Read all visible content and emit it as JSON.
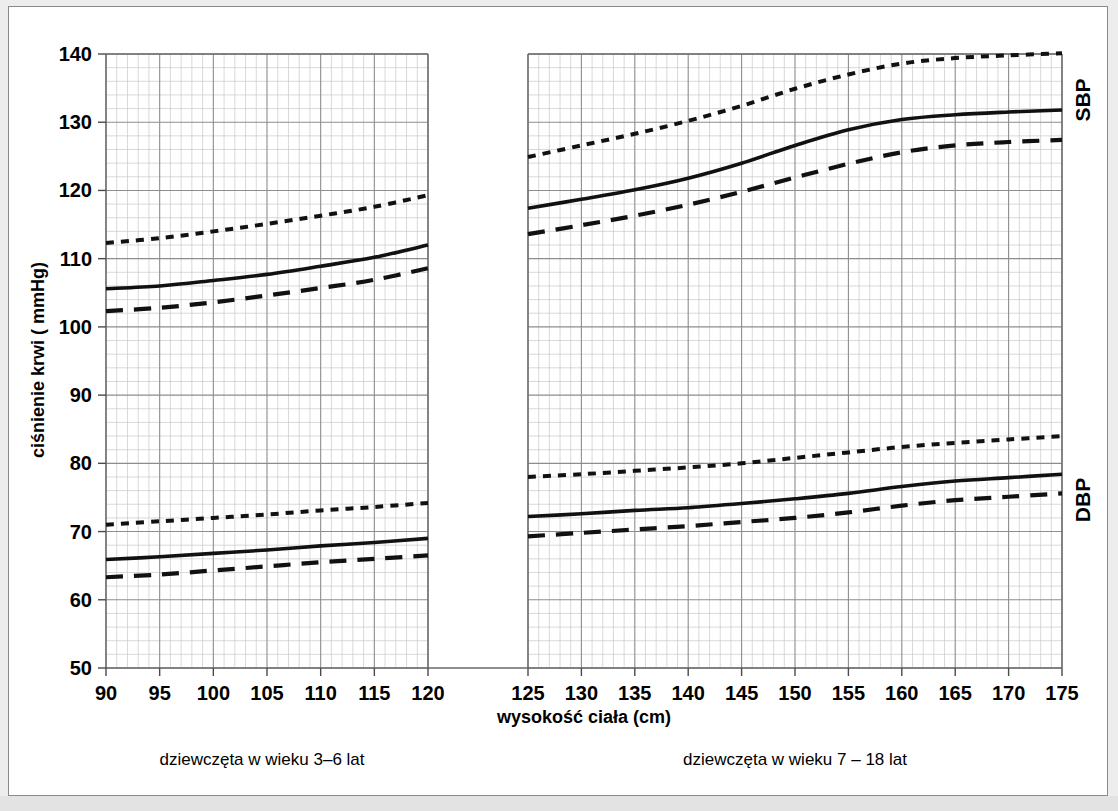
{
  "chart_data": {
    "type": "line",
    "title": "",
    "xlabel": "wysokość ciała (cm)",
    "ylabel": "ciśnienie krwi ( mmHg)",
    "ylim": [
      50,
      140
    ],
    "y_major_step": 10,
    "y_minor_step": 2,
    "y_ticks": [
      50,
      60,
      70,
      80,
      90,
      100,
      110,
      120,
      130,
      140
    ],
    "grid": true,
    "legend_position": "none",
    "panels": [
      {
        "id": "left",
        "caption": "dziewczęta w wieku 3–6 lat",
        "xlim": [
          90,
          120
        ],
        "x_ticks": [
          90,
          95,
          100,
          105,
          110,
          115,
          120
        ],
        "x_minor_step": 1,
        "groups": [
          {
            "name": "SBP",
            "series": [
              {
                "name": "95th percentile",
                "style": "fine-dotted",
                "x": [
                  90,
                  95,
                  100,
                  105,
                  110,
                  115,
                  120
                ],
                "values": [
                  112.3,
                  113.0,
                  114.0,
                  115.1,
                  116.3,
                  117.6,
                  119.3
                ]
              },
              {
                "name": "50th percentile",
                "style": "solid",
                "x": [
                  90,
                  95,
                  100,
                  105,
                  110,
                  115,
                  120
                ],
                "values": [
                  105.6,
                  106.0,
                  106.8,
                  107.7,
                  108.9,
                  110.2,
                  112.0
                ]
              },
              {
                "name": "5th percentile",
                "style": "long-dashed",
                "x": [
                  90,
                  95,
                  100,
                  105,
                  110,
                  115,
                  120
                ],
                "values": [
                  102.3,
                  102.8,
                  103.6,
                  104.6,
                  105.7,
                  106.9,
                  108.6
                ]
              }
            ]
          },
          {
            "name": "DBP",
            "series": [
              {
                "name": "95th percentile",
                "style": "fine-dotted",
                "x": [
                  90,
                  95,
                  100,
                  105,
                  110,
                  115,
                  120
                ],
                "values": [
                  71.0,
                  71.5,
                  72.0,
                  72.5,
                  73.1,
                  73.6,
                  74.2
                ]
              },
              {
                "name": "50th percentile",
                "style": "solid",
                "x": [
                  90,
                  95,
                  100,
                  105,
                  110,
                  115,
                  120
                ],
                "values": [
                  65.9,
                  66.3,
                  66.8,
                  67.3,
                  67.9,
                  68.4,
                  69.0
                ]
              },
              {
                "name": "5th percentile",
                "style": "long-dashed",
                "x": [
                  90,
                  95,
                  100,
                  105,
                  110,
                  115,
                  120
                ],
                "values": [
                  63.3,
                  63.7,
                  64.3,
                  64.9,
                  65.5,
                  66.0,
                  66.5
                ]
              }
            ]
          }
        ]
      },
      {
        "id": "right",
        "caption": "dziewczęta w wieku 7 – 18 lat",
        "xlim": [
          125,
          175
        ],
        "x_ticks": [
          125,
          130,
          135,
          140,
          145,
          150,
          155,
          160,
          165,
          170,
          175
        ],
        "x_minor_step": 1,
        "groups": [
          {
            "name": "SBP",
            "series": [
              {
                "name": "95th percentile",
                "style": "fine-dotted",
                "x": [
                  125,
                  130,
                  135,
                  140,
                  145,
                  150,
                  155,
                  160,
                  165,
                  170,
                  175
                ],
                "values": [
                  124.9,
                  126.6,
                  128.3,
                  130.2,
                  132.4,
                  134.9,
                  137.0,
                  138.6,
                  139.4,
                  139.8,
                  140.1
                ]
              },
              {
                "name": "50th percentile",
                "style": "solid",
                "x": [
                  125,
                  130,
                  135,
                  140,
                  145,
                  150,
                  155,
                  160,
                  165,
                  170,
                  175
                ],
                "values": [
                  117.4,
                  118.7,
                  120.1,
                  121.8,
                  124.0,
                  126.6,
                  128.9,
                  130.4,
                  131.1,
                  131.5,
                  131.8
                ]
              },
              {
                "name": "5th percentile",
                "style": "long-dashed",
                "x": [
                  125,
                  130,
                  135,
                  140,
                  145,
                  150,
                  155,
                  160,
                  165,
                  170,
                  175
                ],
                "values": [
                  113.6,
                  114.9,
                  116.3,
                  117.9,
                  119.8,
                  121.9,
                  123.9,
                  125.6,
                  126.6,
                  127.1,
                  127.4
                ]
              }
            ]
          },
          {
            "name": "DBP",
            "series": [
              {
                "name": "95th percentile",
                "style": "fine-dotted",
                "x": [
                  125,
                  130,
                  135,
                  140,
                  145,
                  150,
                  155,
                  160,
                  165,
                  170,
                  175
                ],
                "values": [
                  78.0,
                  78.4,
                  78.9,
                  79.4,
                  80.0,
                  80.8,
                  81.6,
                  82.4,
                  83.0,
                  83.5,
                  84.0
                ]
              },
              {
                "name": "50th percentile",
                "style": "solid",
                "x": [
                  125,
                  130,
                  135,
                  140,
                  145,
                  150,
                  155,
                  160,
                  165,
                  170,
                  175
                ],
                "values": [
                  72.2,
                  72.6,
                  73.1,
                  73.5,
                  74.1,
                  74.8,
                  75.6,
                  76.6,
                  77.4,
                  77.9,
                  78.4
                ]
              },
              {
                "name": "5th percentile",
                "style": "long-dashed",
                "x": [
                  125,
                  130,
                  135,
                  140,
                  145,
                  150,
                  155,
                  160,
                  165,
                  170,
                  175
                ],
                "values": [
                  69.3,
                  69.8,
                  70.3,
                  70.8,
                  71.4,
                  72.0,
                  72.8,
                  73.8,
                  74.6,
                  75.1,
                  75.6
                ]
              }
            ]
          }
        ]
      }
    ],
    "right_labels": [
      "SBP",
      "DBP"
    ],
    "colors": {
      "curve": "#111111",
      "grid_major": "#8d8d8d",
      "grid_minor": "#c9c9c9",
      "background": "#ffffff"
    }
  }
}
